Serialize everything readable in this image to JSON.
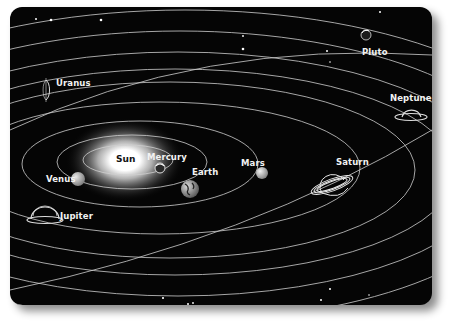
{
  "diagram": {
    "background_color": "#050505",
    "orbit_color": "#cfcfcf",
    "sun": {
      "label": "Sun"
    },
    "planets": [
      {
        "name": "Mercury",
        "label": "Mercury"
      },
      {
        "name": "Venus",
        "label": "Venus"
      },
      {
        "name": "Earth",
        "label": "Earth"
      },
      {
        "name": "Mars",
        "label": "Mars"
      },
      {
        "name": "Jupiter",
        "label": "Jupiter"
      },
      {
        "name": "Saturn",
        "label": "Saturn"
      },
      {
        "name": "Uranus",
        "label": "Uranus"
      },
      {
        "name": "Neptune",
        "label": "Neptune"
      },
      {
        "name": "Pluto",
        "label": "Pluto"
      }
    ]
  }
}
